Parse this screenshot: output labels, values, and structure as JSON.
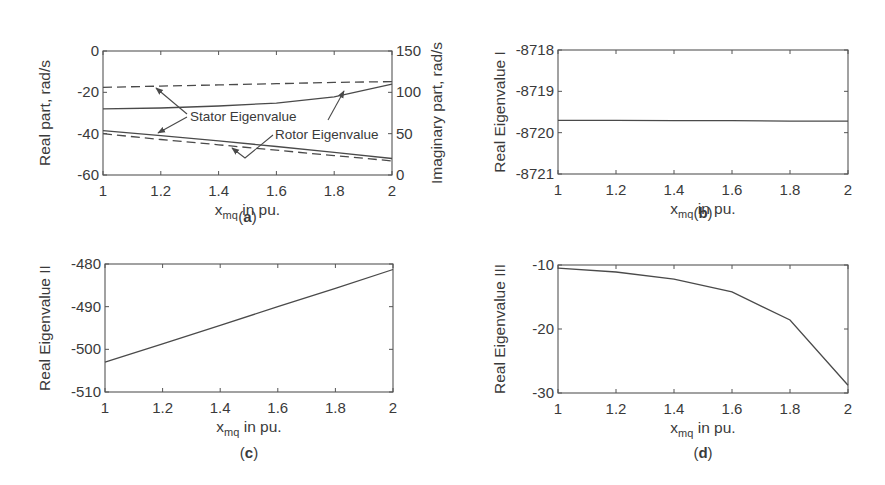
{
  "chart_data": [
    {
      "id": "a",
      "type": "line",
      "caption": "a",
      "xlabel": "x_mq in pu.",
      "xlabel_main": "x",
      "xlabel_sub": "mq",
      "xlabel_tail": " in pu.",
      "ylabel": "Real part, rad/s",
      "ylabel_right": "Imaginary part, rad/s",
      "xlim": [
        1,
        2
      ],
      "ylim": [
        -60,
        0
      ],
      "ylim_right": [
        0,
        150
      ],
      "xticks": [
        "1",
        "1.2",
        "1.4",
        "1.6",
        "1.8",
        "2"
      ],
      "yticks": [
        "0",
        "-20",
        "-40",
        "-60"
      ],
      "yticks_right": [
        "150",
        "100",
        "50",
        "0"
      ],
      "x": [
        1,
        1.2,
        1.4,
        1.6,
        1.8,
        2
      ],
      "series": [
        {
          "name": "Stator Eigenvalue (real)",
          "axis": "left",
          "style": "solid",
          "values": [
            -28,
            -27.6,
            -26.6,
            -25.2,
            -22.2,
            -16
          ]
        },
        {
          "name": "Rotor Eigenvalue (real)",
          "axis": "left",
          "style": "solid",
          "values": [
            -38.5,
            -41,
            -43.5,
            -46.2,
            -49,
            -52
          ]
        },
        {
          "name": "Stator Eigenvalue (imag)",
          "axis": "right",
          "style": "dashed",
          "values": [
            106,
            107.5,
            109,
            110.5,
            112,
            113
          ]
        },
        {
          "name": "Rotor Eigenvalue (imag)",
          "axis": "right",
          "style": "dashed",
          "values": [
            50,
            43,
            36.5,
            30,
            23.5,
            17
          ]
        }
      ],
      "annotations": [
        "Stator Eigenvalue",
        "Rotor Eigenvalue"
      ]
    },
    {
      "id": "b",
      "type": "line",
      "caption": "b",
      "xlabel": "x_mq in pu.",
      "xlabel_main": "x",
      "xlabel_sub": "mq",
      "xlabel_tail": " in pu.",
      "ylabel": "Real Eigenvalue I",
      "xlim": [
        1,
        2
      ],
      "ylim": [
        -8721,
        -8718
      ],
      "xticks": [
        "1",
        "1.2",
        "1.4",
        "1.6",
        "1.8",
        "2"
      ],
      "yticks": [
        "-8718",
        "-8719",
        "-8720",
        "-8721"
      ],
      "x": [
        1,
        1.2,
        1.4,
        1.6,
        1.8,
        2
      ],
      "values": [
        -8719.7,
        -8719.7,
        -8719.71,
        -8719.71,
        -8719.72,
        -8719.72
      ]
    },
    {
      "id": "c",
      "type": "line",
      "caption": "c",
      "xlabel": "x_mq in pu.",
      "xlabel_main": "x",
      "xlabel_sub": "mq",
      "xlabel_tail": " in pu.",
      "ylabel": "Real Eigenvalue II",
      "xlim": [
        1,
        2
      ],
      "ylim": [
        -510,
        -480
      ],
      "xticks": [
        "1",
        "1.2",
        "1.4",
        "1.6",
        "1.8",
        "2"
      ],
      "yticks": [
        "-480",
        "-490",
        "-500",
        "-510"
      ],
      "x": [
        1,
        1.2,
        1.4,
        1.6,
        1.8,
        2
      ],
      "values": [
        -503,
        -498.7,
        -494.4,
        -490,
        -485.7,
        -481.3
      ]
    },
    {
      "id": "d",
      "type": "line",
      "caption": "d",
      "xlabel": "x_mq in pu.",
      "xlabel_main": "x",
      "xlabel_sub": "mq",
      "xlabel_tail": " in pu.",
      "ylabel": "Real Eigenvalue III",
      "xlim": [
        1,
        2
      ],
      "ylim": [
        -30,
        -10
      ],
      "xticks": [
        "1",
        "1.2",
        "1.4",
        "1.6",
        "1.8",
        "2"
      ],
      "yticks": [
        "-10",
        "-20",
        "-30"
      ],
      "x": [
        1,
        1.2,
        1.4,
        1.6,
        1.8,
        2
      ],
      "values": [
        -10.5,
        -11.1,
        -12.2,
        -14.2,
        -18.6,
        -28.8
      ]
    }
  ]
}
